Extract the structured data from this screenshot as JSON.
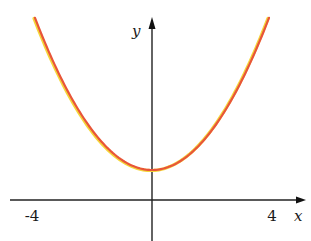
{
  "chart_data": {
    "type": "line",
    "title": "",
    "function": "y = x^2/3 + 1",
    "xlabel": "x",
    "ylabel": "y",
    "xlim": [
      -4.7,
      5.1
    ],
    "ylim": [
      -1.4,
      6.1
    ],
    "x_tick_labels": [
      {
        "value": -4,
        "label": "-4"
      },
      {
        "value": 4,
        "label": "4"
      }
    ],
    "series": [
      {
        "name": "parabola",
        "color": "#e8553a",
        "highlight_color": "#f5d63a",
        "x": [
          -3.9,
          -3.5,
          -3.0,
          -2.5,
          -2.0,
          -1.5,
          -1.0,
          -0.5,
          0,
          0.5,
          1.0,
          1.5,
          2.0,
          2.5,
          3.0,
          3.5,
          3.9
        ],
        "y": [
          6.07,
          5.08,
          4.0,
          3.08,
          2.33,
          1.75,
          1.33,
          1.08,
          1.0,
          1.08,
          1.33,
          1.75,
          2.33,
          3.08,
          4.0,
          5.08,
          6.07
        ]
      }
    ],
    "grid": false,
    "legend": "none"
  }
}
